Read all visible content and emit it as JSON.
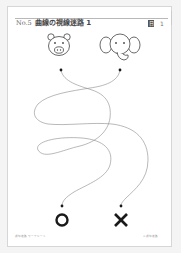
{
  "header": {
    "number": "No.5",
    "title": "曲線の視線迷路 1",
    "badge": "日",
    "page_mark": "1"
  },
  "start_icons": [
    {
      "name": "pig",
      "label": "pig-face"
    },
    {
      "name": "elephant",
      "label": "elephant-face"
    }
  ],
  "goal_marks": [
    {
      "symbol": "O",
      "name": "circle-goal"
    },
    {
      "symbol": "X",
      "name": "cross-goal"
    }
  ],
  "footer": {
    "left": "視線迷路 ワークシート",
    "right": "© 視線迷路"
  },
  "colors": {
    "line": "#8a8a8a",
    "ink": "#1a1a1a",
    "border": "#d6d6d6"
  }
}
